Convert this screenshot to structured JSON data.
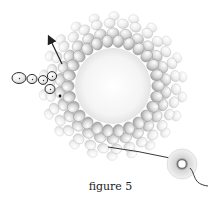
{
  "figure": {
    "caption": "figure 5"
  },
  "geometry": {
    "center": [
      113,
      86
    ],
    "hole_radius": 38,
    "inner_ring": {
      "radius": 45,
      "count": 26,
      "bead_rx": 6.2,
      "bead_ry": 5.4
    },
    "mid_ring": {
      "radius": 53,
      "count": 26,
      "offset_deg": 7
    },
    "outer_ring": {
      "radius": 63,
      "count": 30,
      "offset_deg": 3
    },
    "outer_ring2": {
      "radius": 70,
      "count": 22,
      "offset_deg": 9
    }
  },
  "highlighted_beads": [
    {
      "cx": 19,
      "cy": 78,
      "rx": 7,
      "ry": 5.5
    },
    {
      "cx": 32,
      "cy": 79,
      "rx": 5,
      "ry": 4.6
    },
    {
      "cx": 43,
      "cy": 80,
      "rx": 4.6,
      "ry": 4.4
    },
    {
      "cx": 52,
      "cy": 76,
      "rx": 4.6,
      "ry": 4.4
    },
    {
      "cx": 50,
      "cy": 89,
      "rx": 5,
      "ry": 4.6
    }
  ],
  "arrow": {
    "from": [
      62,
      64
    ],
    "to": [
      50,
      39
    ]
  },
  "thread": {
    "from": [
      108,
      147
    ],
    "to": [
      170,
      158
    ]
  },
  "spool": {
    "cx": 182,
    "cy": 164,
    "r_outer": 15,
    "r_inner": 4.5
  },
  "colors": {
    "bead_fill": "#d8d8d8",
    "bead_light": "#f2f2f2",
    "bead_stroke": "#9a9a9a",
    "outline": "#333333",
    "thread": "#222222",
    "caption": "#222222"
  }
}
